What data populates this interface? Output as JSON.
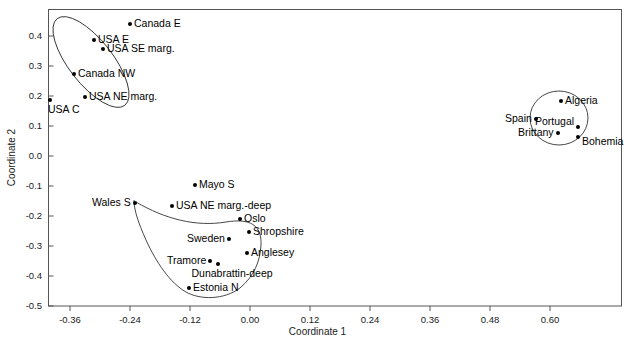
{
  "chart_data": {
    "type": "scatter",
    "title": "",
    "xlabel": "Coordinate 1",
    "ylabel": "Coordinate 2",
    "xlim": [
      -0.42,
      0.695
    ],
    "ylim": [
      -0.5,
      0.49
    ],
    "xticks": [
      "-0.36",
      "-0.24",
      "-0.12",
      "0.00",
      "0.12",
      "0.24",
      "0.36",
      "0.48",
      "0.60"
    ],
    "xtick_values": [
      -0.36,
      -0.24,
      -0.12,
      0.0,
      0.12,
      0.24,
      0.36,
      0.48,
      0.6
    ],
    "yticks": [
      "0.4",
      "0.3",
      "0.2",
      "0.1",
      "0.0",
      "-0.1",
      "-0.2",
      "-0.3",
      "-0.4",
      "-0.5"
    ],
    "ytick_values": [
      0.4,
      0.3,
      0.2,
      0.1,
      0.0,
      -0.1,
      -0.2,
      -0.3,
      -0.4,
      -0.5
    ],
    "grid": false,
    "legend": "none",
    "marker_color": "#000000",
    "points": [
      {
        "label": "Canada E",
        "x": -0.24,
        "y": 0.44,
        "label_pos": "right"
      },
      {
        "label": "USA E",
        "x": -0.312,
        "y": 0.387,
        "label_pos": "right"
      },
      {
        "label": "USA SE marg.",
        "x": -0.294,
        "y": 0.357,
        "label_pos": "right"
      },
      {
        "label": "Canada NW",
        "x": -0.352,
        "y": 0.273,
        "label_pos": "right"
      },
      {
        "label": "USA NE marg.",
        "x": -0.33,
        "y": 0.197,
        "label_pos": "right"
      },
      {
        "label": "USA C",
        "x": -0.4,
        "y": 0.187,
        "label_pos": "below-right"
      },
      {
        "label": "Algeria",
        "x": 0.622,
        "y": 0.183,
        "label_pos": "right"
      },
      {
        "label": "Spain",
        "x": 0.572,
        "y": 0.123,
        "label_pos": "left"
      },
      {
        "label": "Portugal",
        "x": 0.656,
        "y": 0.097,
        "label_pos": "left-above"
      },
      {
        "label": "Brittany",
        "x": 0.616,
        "y": 0.077,
        "label_pos": "left"
      },
      {
        "label": "Bohemia",
        "x": 0.656,
        "y": 0.063,
        "label_pos": "right-below"
      },
      {
        "label": "Mayo S",
        "x": -0.11,
        "y": -0.097,
        "label_pos": "right"
      },
      {
        "label": "Wales S",
        "x": -0.23,
        "y": -0.157,
        "label_pos": "left"
      },
      {
        "label": "USA NE marg.-deep",
        "x": -0.156,
        "y": -0.167,
        "label_pos": "right"
      },
      {
        "label": "Oslo",
        "x": -0.02,
        "y": -0.21,
        "label_pos": "right"
      },
      {
        "label": "Shropshire",
        "x": -0.002,
        "y": -0.253,
        "label_pos": "right"
      },
      {
        "label": "Sweden",
        "x": -0.042,
        "y": -0.277,
        "label_pos": "left"
      },
      {
        "label": "Anglesey",
        "x": -0.006,
        "y": -0.323,
        "label_pos": "right"
      },
      {
        "label": "Tramore",
        "x": -0.08,
        "y": -0.35,
        "label_pos": "left"
      },
      {
        "label": "Dunabrattin-deep",
        "x": -0.064,
        "y": -0.36,
        "label_pos": "below"
      },
      {
        "label": "Estonia N",
        "x": -0.122,
        "y": -0.44,
        "label_pos": "right"
      }
    ],
    "clusters": [
      {
        "name": "north-america-cluster",
        "shape": "ellipse"
      },
      {
        "name": "iberia-cluster",
        "shape": "ellipse"
      },
      {
        "name": "northern-europe-cluster",
        "shape": "lasso"
      }
    ]
  }
}
